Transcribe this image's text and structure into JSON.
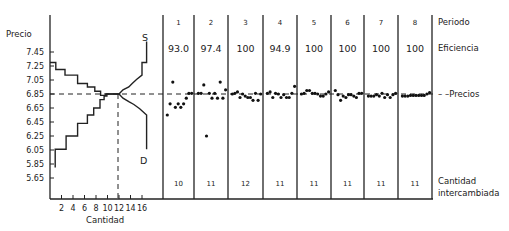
{
  "chart_data": [
    {
      "type": "line",
      "title": "",
      "subtitle": "Supply and demand step curves",
      "xlabel": "Cantidad",
      "ylabel": "Precio",
      "x_ticks": [
        2,
        4,
        6,
        8,
        10,
        12,
        14,
        16
      ],
      "y_ticks": [
        7.45,
        7.25,
        7.05,
        6.85,
        6.65,
        6.45,
        6.25,
        6.05,
        5.85,
        5.65
      ],
      "xlim": [
        0,
        19
      ],
      "ylim": [
        5.55,
        7.65
      ],
      "grid": false,
      "equilibrium": {
        "quantity": 12,
        "price": 6.85
      },
      "series": [
        {
          "name": "D",
          "label": "D",
          "steps": [
            [
              0,
              7.3
            ],
            [
              1,
              7.3
            ],
            [
              1,
              7.2
            ],
            [
              2.6,
              7.2
            ],
            [
              2.6,
              7.12
            ],
            [
              4.8,
              7.12
            ],
            [
              4.8,
              7.0
            ],
            [
              6.5,
              7.0
            ],
            [
              6.5,
              6.95
            ],
            [
              7.8,
              6.95
            ],
            [
              7.8,
              6.89
            ],
            [
              8.8,
              6.89
            ],
            [
              8.8,
              6.83
            ],
            [
              9.7,
              6.83
            ],
            [
              9.7,
              6.85
            ],
            [
              12,
              6.85
            ],
            [
              12.7,
              6.79
            ],
            [
              13.7,
              6.74
            ],
            [
              14.6,
              6.7
            ],
            [
              15.6,
              6.64
            ],
            [
              16.8,
              6.55
            ],
            [
              16.8,
              6.06
            ]
          ]
        },
        {
          "name": "S",
          "label": "S",
          "steps": [
            [
              0.9,
              5.8
            ],
            [
              0.9,
              6.06
            ],
            [
              2.8,
              6.06
            ],
            [
              2.8,
              6.25
            ],
            [
              4.8,
              6.25
            ],
            [
              4.8,
              6.43
            ],
            [
              6.5,
              6.43
            ],
            [
              6.5,
              6.55
            ],
            [
              7.6,
              6.55
            ],
            [
              7.6,
              6.65
            ],
            [
              8.7,
              6.65
            ],
            [
              8.7,
              6.77
            ],
            [
              9.4,
              6.77
            ],
            [
              9.4,
              6.82
            ],
            [
              9.9,
              6.82
            ],
            [
              9.9,
              6.85
            ],
            [
              12,
              6.85
            ],
            [
              12.7,
              6.91
            ],
            [
              13.7,
              6.95
            ],
            [
              14.3,
              7.0
            ],
            [
              15.1,
              7.06
            ],
            [
              16.0,
              7.12
            ],
            [
              16.0,
              7.3
            ],
            [
              16.8,
              7.3
            ],
            [
              16.8,
              7.6
            ]
          ]
        }
      ]
    },
    {
      "type": "scatter",
      "title": "Transaction prices by period",
      "ylabel": "Precios",
      "reference_line": {
        "label": "Precios",
        "value": 6.85,
        "style": "dashed"
      },
      "ylim": [
        5.55,
        7.65
      ],
      "periods": [
        {
          "period": 1,
          "efficiency": "93.0",
          "quantity_traded": 10,
          "prices": [
            6.55,
            6.71,
            7.02,
            6.66,
            6.71,
            6.66,
            6.71,
            6.79,
            6.86,
            6.86
          ]
        },
        {
          "period": 2,
          "efficiency": "97.4",
          "quantity_traded": 11,
          "prices": [
            6.86,
            6.86,
            6.98,
            6.25,
            6.86,
            6.79,
            6.86,
            6.79,
            7.02,
            6.79,
            6.91
          ]
        },
        {
          "period": 3,
          "efficiency": "100",
          "quantity_traded": 12,
          "prices": [
            6.85,
            6.86,
            6.88,
            6.8,
            6.85,
            6.82,
            6.8,
            6.8,
            6.76,
            6.86,
            6.76,
            6.85
          ]
        },
        {
          "period": 4,
          "efficiency": "94.9",
          "quantity_traded": 11,
          "prices": [
            6.86,
            6.88,
            6.8,
            6.86,
            6.85,
            6.8,
            6.84,
            6.8,
            6.8,
            6.86,
            6.96
          ]
        },
        {
          "period": 5,
          "efficiency": "100",
          "quantity_traded": 11,
          "prices": [
            6.85,
            6.86,
            6.9,
            6.9,
            6.86,
            6.86,
            6.85,
            6.82,
            6.82,
            6.85,
            6.88
          ]
        },
        {
          "period": 6,
          "efficiency": "100",
          "quantity_traded": 11,
          "prices": [
            6.9,
            6.84,
            6.76,
            6.82,
            6.8,
            6.84,
            6.84,
            6.82,
            6.8,
            6.86,
            6.86
          ]
        },
        {
          "period": 7,
          "efficiency": "100",
          "quantity_traded": 11,
          "prices": [
            6.82,
            6.82,
            6.82,
            6.84,
            6.82,
            6.86,
            6.8,
            6.84,
            6.8,
            6.84,
            6.86
          ]
        },
        {
          "period": 8,
          "efficiency": "100",
          "quantity_traded": 11,
          "prices": [
            6.82,
            6.82,
            6.82,
            6.83,
            6.83,
            6.83,
            6.83,
            6.83,
            6.83,
            6.85,
            6.87
          ]
        }
      ],
      "row_labels": {
        "period": "Periodo",
        "efficiency": "Eficiencia",
        "prices": "Precios",
        "quantity_line1": "Cantidad",
        "quantity_line2": "intercambiada"
      }
    }
  ],
  "labels": {
    "y_axis": "Precio",
    "x_axis": "Cantidad",
    "supply": "S",
    "demand": "D",
    "row_period": "Periodo",
    "row_efficiency": "Eficiencia",
    "row_prices": "– –Precios",
    "row_quantity_1": "Cantidad",
    "row_quantity_2": "intercambiada"
  }
}
